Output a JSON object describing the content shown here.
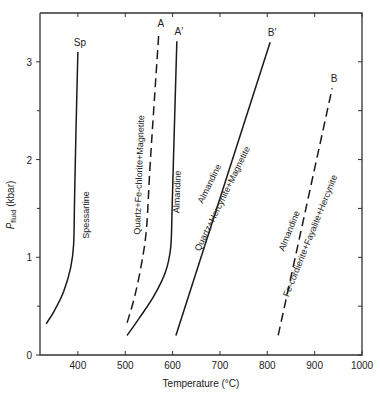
{
  "chart_data": {
    "type": "line",
    "title": "",
    "xlabel": "Temperature (°C)",
    "ylabel": "P_fluid (kbar)",
    "ylabel_main": "P",
    "ylabel_sub": "fluid",
    "ylabel_unit": "(kbar)",
    "xlim": [
      320,
      1000
    ],
    "ylim": [
      0,
      3.5
    ],
    "xticks": [
      400,
      500,
      600,
      700,
      800,
      900,
      1000
    ],
    "yticks_major": [
      0,
      1,
      2,
      3
    ],
    "yticks_minor": [
      0.5,
      1.5,
      2.5
    ],
    "grid": false,
    "series": [
      {
        "name": "Sp",
        "end_label": "Sp",
        "curve_label": "Spessartine",
        "style": "solid",
        "points": [
          [
            333,
            0.32
          ],
          [
            350,
            0.45
          ],
          [
            370,
            0.65
          ],
          [
            385,
            0.9
          ],
          [
            391,
            1.13
          ],
          [
            393,
            1.6
          ],
          [
            396,
            2.3
          ],
          [
            400,
            3.1
          ]
        ]
      },
      {
        "name": "A",
        "end_label": "A",
        "curve_label": "Quartz+Fe-chlorite+Magnetite",
        "style": "dashed",
        "points": [
          [
            504,
            0.33
          ],
          [
            520,
            0.6
          ],
          [
            535,
            0.95
          ],
          [
            545,
            1.3
          ],
          [
            552,
            1.9
          ],
          [
            560,
            2.5
          ],
          [
            571,
            3.3
          ]
        ]
      },
      {
        "name": "A'",
        "end_label": "A′",
        "curve_label": "Almandine",
        "style": "solid",
        "points": [
          [
            504,
            0.2
          ],
          [
            530,
            0.38
          ],
          [
            560,
            0.6
          ],
          [
            585,
            0.85
          ],
          [
            596,
            1.1
          ],
          [
            599,
            1.5
          ],
          [
            603,
            2.2
          ],
          [
            609,
            3.21
          ]
        ]
      },
      {
        "name": "B'",
        "end_label": "B′",
        "curve_label_upper": "Almandine",
        "curve_label_lower": "Quartz+Hercynite+Magnetite",
        "style": "solid",
        "points": [
          [
            607,
            0.2
          ],
          [
            806,
            3.2
          ]
        ]
      },
      {
        "name": "B",
        "end_label": "B",
        "curve_label_upper": "Almandine",
        "curve_label_lower": "Fe-cordierite+Fayalite+Hercynite",
        "style": "dashed",
        "points": [
          [
            823,
            0.2
          ],
          [
            937,
            2.73
          ]
        ]
      }
    ]
  }
}
